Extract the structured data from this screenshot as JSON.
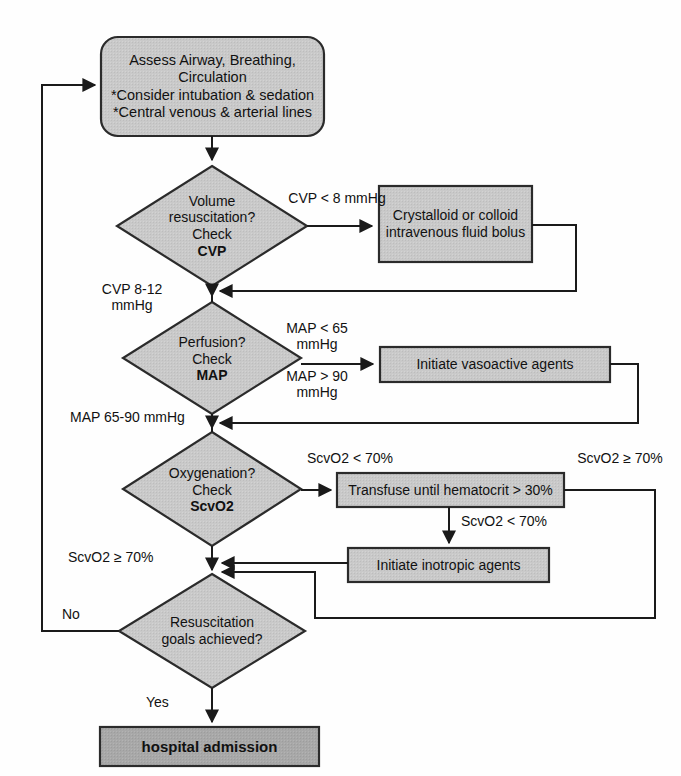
{
  "diagram": {
    "type": "clinical-flowchart",
    "title_shown": false,
    "colors": {
      "node_fill": "#c9c9c9",
      "terminal_fill": "#a8a8a8",
      "node_stroke": "#2b2b2b",
      "line": "#1a1a1a",
      "text": "#111111",
      "background": "#fefefe"
    },
    "nodes": {
      "assess": {
        "shape": "rounded-rect",
        "line1": "Assess Airway, Breathing,",
        "line2": "Circulation",
        "line3": "*Consider intubation & sedation",
        "line4": "*Central venous & arterial lines"
      },
      "volume": {
        "shape": "diamond",
        "line1": "Volume",
        "line2": "resuscitation?",
        "line3": "Check",
        "line4": "CVP"
      },
      "crystalloid": {
        "shape": "rect",
        "line1": "Crystalloid or colloid",
        "line2": "intravenous fluid bolus"
      },
      "perfusion": {
        "shape": "diamond",
        "line1": "Perfusion?",
        "line2": "Check",
        "line3": "MAP"
      },
      "vasoactive": {
        "shape": "rect",
        "line1": "Initiate vasoactive agents"
      },
      "oxygenation": {
        "shape": "diamond",
        "line1": "Oxygenation?",
        "line2": "Check",
        "line3": "ScvO2"
      },
      "transfuse": {
        "shape": "rect",
        "line1": "Transfuse until hematocrit > 30%"
      },
      "inotropic": {
        "shape": "rect",
        "line1": "Initiate inotropic agents"
      },
      "goals": {
        "shape": "diamond",
        "line1": "Resuscitation",
        "line2": "goals achieved?"
      },
      "admission": {
        "shape": "rect-terminal",
        "line1": "hospital admission"
      }
    },
    "edge_labels": {
      "cvp_low": "CVP < 8 mmHg",
      "cvp_target": "CVP 8-12\nmmHg",
      "map_low": "MAP < 65\nmmHg",
      "map_high": "MAP > 90\nmmHg",
      "map_target": "MAP 65-90 mmHg",
      "scvo2_low": "ScvO2 < 70%",
      "scvo2_high_right": "ScvO2 ≥ 70%",
      "scvo2_low_transfuse": "ScvO2 < 70%",
      "scvo2_high_left": "ScvO2 ≥ 70%",
      "no": "No",
      "yes": "Yes"
    }
  }
}
